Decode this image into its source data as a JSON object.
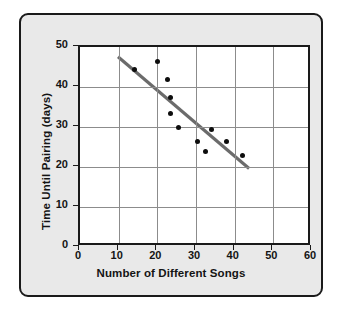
{
  "chart_data": {
    "type": "scatter",
    "title": "",
    "xlabel": "Number of Different Songs",
    "ylabel": "Time Until Pairing (days)",
    "xlim": [
      0,
      60
    ],
    "ylim": [
      0,
      50
    ],
    "xticks": [
      0,
      10,
      20,
      30,
      40,
      50,
      60
    ],
    "yticks": [
      0,
      10,
      20,
      30,
      40,
      50
    ],
    "grid": true,
    "legend": "none",
    "point_color": "#0d0d0d",
    "trendline_color": "#6b6b6b",
    "points": [
      {
        "x": 14,
        "y": 44.5
      },
      {
        "x": 20,
        "y": 46.5
      },
      {
        "x": 22.5,
        "y": 42
      },
      {
        "x": 23.5,
        "y": 37.5
      },
      {
        "x": 23.5,
        "y": 33.5
      },
      {
        "x": 25.5,
        "y": 30
      },
      {
        "x": 30.5,
        "y": 26.5
      },
      {
        "x": 32.5,
        "y": 23.8
      },
      {
        "x": 34,
        "y": 29.5
      },
      {
        "x": 38,
        "y": 26.5
      },
      {
        "x": 42,
        "y": 23
      }
    ],
    "trendline": {
      "x1": 10,
      "y1": 47.5,
      "x2": 44.5,
      "y2": 19
    }
  },
  "axes": {
    "x_tick_labels": [
      "0",
      "10",
      "20",
      "30",
      "40",
      "50",
      "60"
    ],
    "y_tick_labels": [
      "0",
      "10",
      "20",
      "30",
      "40",
      "50"
    ],
    "x_title": "Number of Different Songs",
    "y_title": "Time Until Pairing (days)"
  }
}
